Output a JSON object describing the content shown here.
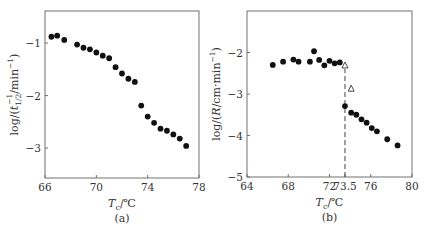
{
  "chart_data": [
    {
      "id": "a",
      "type": "scatter",
      "caption": "(a)",
      "title": "",
      "xlabel": "T_c/℃",
      "ylabel": "log/(t_1/2^-1/min^-1)",
      "xlim": [
        66,
        78
      ],
      "ylim": [
        -3.57,
        -0.39
      ],
      "xticks": [
        66,
        70,
        74,
        78
      ],
      "yticks": [
        -1,
        -2,
        -3
      ],
      "xtick_labels": [
        "66",
        "70",
        "74",
        "78"
      ],
      "ytick_labels": [
        "-1",
        "-2",
        "-3"
      ],
      "grid": false,
      "legend": null,
      "series": [
        {
          "name": "filled circles",
          "marker": "circle-filled",
          "x": [
            66.5,
            66.95,
            67.5,
            68.5,
            69.0,
            69.5,
            70.0,
            70.5,
            71.0,
            71.5,
            72.0,
            72.5,
            73.0,
            73.5,
            74.0,
            74.5,
            75.0,
            75.5,
            76.0,
            76.5,
            77.0
          ],
          "y": [
            -0.88,
            -0.86,
            -0.94,
            -1.03,
            -1.09,
            -1.12,
            -1.18,
            -1.24,
            -1.29,
            -1.46,
            -1.58,
            -1.68,
            -1.74,
            -2.19,
            -2.4,
            -2.52,
            -2.63,
            -2.67,
            -2.74,
            -2.82,
            -2.96
          ]
        }
      ],
      "frame_px": {
        "left": 45,
        "right": 199,
        "top": 11,
        "bottom": 178
      }
    },
    {
      "id": "b",
      "type": "scatter",
      "caption": "(b)",
      "title": "",
      "xlabel": "T_c/℃",
      "ylabel": "log/(R/cm·min^-1)",
      "xlim": [
        64,
        80
      ],
      "ylim": [
        -5,
        -1
      ],
      "xticks": [
        64,
        68,
        72,
        73.5,
        76,
        80
      ],
      "yticks": [
        -2,
        -3,
        -4,
        -5
      ],
      "xtick_labels": [
        "64",
        "68",
        "72",
        "73.5",
        "76",
        "80"
      ],
      "ytick_labels": [
        "-2",
        "-3",
        "-4",
        "-5"
      ],
      "grid": false,
      "legend": null,
      "series": [
        {
          "name": "filled circles (below 73.5 ℃)",
          "marker": "circle-filled",
          "x": [
            66.5,
            67.5,
            68.5,
            69.0,
            70.1,
            70.5,
            71.0,
            71.5,
            72.0,
            72.5,
            73.0
          ],
          "y": [
            -2.3,
            -2.22,
            -2.17,
            -2.22,
            -2.22,
            -1.97,
            -2.18,
            -2.31,
            -2.2,
            -2.26,
            -2.24
          ]
        },
        {
          "name": "filled circles (above 73.5 ℃)",
          "marker": "circle-filled",
          "x": [
            73.5,
            74.1,
            74.6,
            75.1,
            75.6,
            76.1,
            76.6,
            77.6,
            78.6
          ],
          "y": [
            -3.29,
            -3.45,
            -3.5,
            -3.61,
            -3.69,
            -3.82,
            -3.9,
            -4.09,
            -4.24
          ]
        },
        {
          "name": "open triangles",
          "marker": "triangle-open",
          "x": [
            73.5,
            74.1
          ],
          "y": [
            -2.3,
            -2.86
          ]
        }
      ],
      "annotations": [
        {
          "type": "dashed-vline",
          "x": 73.5,
          "y_from": -5,
          "y_to": -2.3,
          "label": "73.5"
        }
      ],
      "frame_px": {
        "left": 247,
        "right": 412,
        "top": 11,
        "bottom": 177
      }
    }
  ]
}
